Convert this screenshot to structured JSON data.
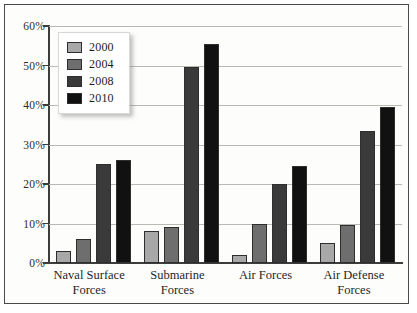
{
  "chart_data": {
    "type": "bar",
    "title": "",
    "subtitle": "",
    "xlabel": "",
    "ylabel": "",
    "ylim": [
      0,
      60
    ],
    "ytick_labels": [
      "60%",
      "50%",
      "40%",
      "30%",
      "20%",
      "10%",
      "0%"
    ],
    "ytick_values": [
      60,
      50,
      40,
      30,
      20,
      10,
      0
    ],
    "grid": true,
    "legend_position": "upper-left-inside",
    "categories": [
      "Naval Surface Forces",
      "Submarine Forces",
      "Air Forces",
      "Air Defense Forces"
    ],
    "category_lines": [
      [
        "Naval Surface",
        "Forces"
      ],
      [
        "Submarine",
        "Forces"
      ],
      [
        "Air Forces",
        ""
      ],
      [
        "Air Defense",
        "Forces"
      ]
    ],
    "series": [
      {
        "name": "2000",
        "color": "#a8a8a8",
        "values": [
          3,
          8,
          2,
          5
        ]
      },
      {
        "name": "2004",
        "color": "#6e6e6e",
        "values": [
          6,
          9,
          10,
          9.5
        ]
      },
      {
        "name": "2008",
        "color": "#3a3a3a",
        "values": [
          25,
          49.5,
          20,
          33.5
        ]
      },
      {
        "name": "2010",
        "color": "#111111",
        "values": [
          26,
          55.5,
          24.5,
          39.5
        ]
      }
    ]
  }
}
